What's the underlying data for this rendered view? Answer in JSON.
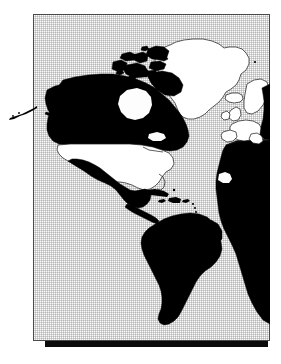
{
  "figure": {
    "kind": "world-map-figure",
    "alt_text": "World map with the Americas at centre; Canada, Alaska, Mexico, Central America, South America, Africa and eastern Europe shaded solid black while the United States, Greenland, Iceland and western Europe are left white with outlines",
    "projection_note": "Equirectangular, Atlantic-centred",
    "colors": {
      "page_background": "#ffffff",
      "ocean_fill": "#fdfdfd",
      "ocean_dither": "#969696",
      "frame_border": "#4a4a4a",
      "shadow_bar": "#0b0b0b",
      "land_highlighted": "#000000",
      "land_plain_fill": "#ffffff",
      "land_plain_stroke": "#1a1a1a"
    },
    "frame": {
      "x": 33,
      "y": 14,
      "width": 237,
      "height": 327,
      "border_width_px": 1,
      "shadow": {
        "x": 45,
        "y": 341,
        "width": 223,
        "height": 6
      }
    }
  },
  "legend": {
    "shown": false,
    "filled_meaning": "highlighted / selected region",
    "outline_meaning": "not highlighted region"
  },
  "regions": {
    "filled_black": [
      "Alaska",
      "Aleutian Islands",
      "Canada",
      "Canadian Arctic Archipelago",
      "Mexico",
      "Central America",
      "Cuba",
      "Hispaniola",
      "South America",
      "Africa",
      "Eastern Europe",
      "Western Russia"
    ],
    "outlined_white": [
      "United States (contiguous)",
      "Greenland",
      "Iceland",
      "United Kingdom",
      "Ireland",
      "Scandinavia",
      "Western Europe",
      "Iberia"
    ]
  },
  "labels": {
    "visible_text": [],
    "note": "No text, axis ticks, legend entries or captions appear inside the image"
  }
}
